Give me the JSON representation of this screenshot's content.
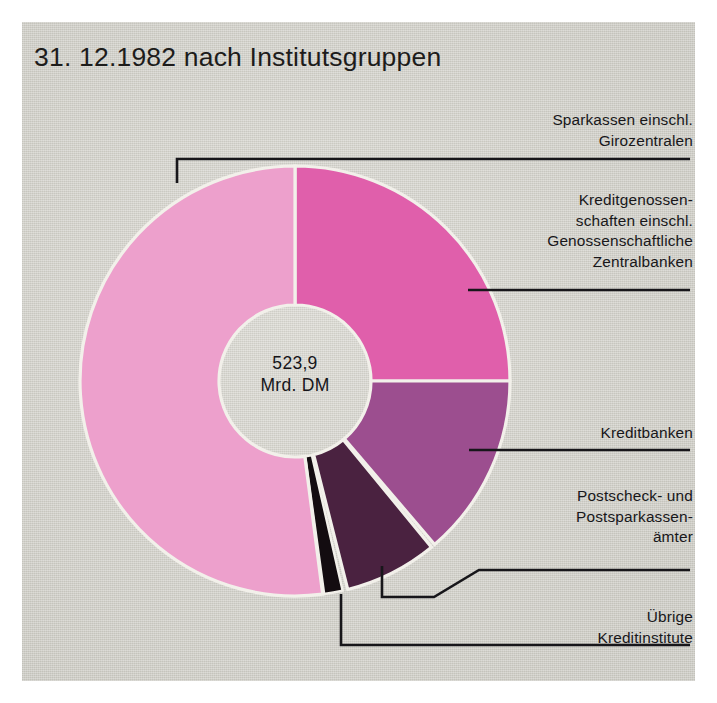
{
  "page": {
    "title": "31. 12.1982 nach Institutsgruppen",
    "panel_bg": "#d3d2ca"
  },
  "center": {
    "value": "523,9",
    "unit": "Mrd. DM"
  },
  "legend": {
    "sparkassen": "Sparkassen einschl.\nGirozentralen",
    "kreditgenossenschaften": "Kreditgenossen-\nschaften einschl.\nGenossenschaftliche\nZentralbanken",
    "kreditbanken": "Kreditbanken",
    "postscheck": "Postscheck- und\nPostsparkassen-\nämter",
    "uebrige": "Übrige\nKreditinstitute"
  },
  "chart_data": {
    "type": "pie",
    "title": "31. 12.1982 nach Institutsgruppen",
    "subtitle": "",
    "center_label": "523,9 Mrd. DM",
    "total": 523.9,
    "unit": "Mrd. DM",
    "donut": true,
    "inner_radius_ratio": 0.355,
    "start_angle_deg": 0,
    "direction": "clockwise",
    "legend_position": "right",
    "grid": false,
    "categories": [
      "Kreditgenossenschaften einschl. Genossenschaftliche Zentralbanken",
      "Kreditbanken",
      "Postscheck- und Postsparkassenämter",
      "Übrige Kreditinstitute",
      "Sparkassen einschl. Girozentralen"
    ],
    "values": [
      131.0,
      72.3,
      36.6,
      7.3,
      276.7
    ],
    "percentages": [
      25.0,
      13.8,
      7.0,
      1.4,
      52.8
    ],
    "angles_deg": [
      {
        "name": "Kreditgenossenschaften einschl. Genossenschaftliche Zentralbanken",
        "start": 0.0,
        "end": 90.0,
        "color": "#e05fab"
      },
      {
        "name": "Kreditbanken",
        "start": 90.0,
        "end": 139.5,
        "color": "#9c4e8f"
      },
      {
        "name": "Postscheck- und Postsparkassenämter",
        "start": 140.6,
        "end": 165.8,
        "color": "#4a2240"
      },
      {
        "name": "Übrige Kreditinstitute",
        "start": 167.2,
        "end": 172.2,
        "color": "#130c10"
      },
      {
        "name": "Sparkassen einschl. Girozentralen",
        "start": 172.6,
        "end": 360.0,
        "color": "#eda0cc"
      }
    ],
    "colors": [
      "#e05fab",
      "#9c4e8f",
      "#4a2240",
      "#130c10",
      "#eda0cc"
    ]
  },
  "colors": {
    "sparkassen": "#eda0cc",
    "kreditgenossenschaften": "#e05fab",
    "kreditbanken": "#9c4e8f",
    "postscheck": "#4a2240",
    "uebrige": "#130c10",
    "leader": "#17161a",
    "text": "#18171a"
  }
}
